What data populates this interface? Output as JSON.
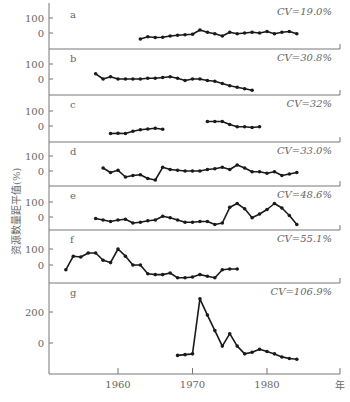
{
  "chart_data": {
    "type": "line",
    "title": "",
    "ylabel": "资源数量距平值(%)",
    "xlabel": "年",
    "x_ticks": [
      1960,
      1970,
      1980
    ],
    "grid": false,
    "legend": "none",
    "panels": [
      {
        "id": "a",
        "cv": "CV=19.0%",
        "y_ticks": [
          0,
          100
        ],
        "x": [
          1963,
          1964,
          1965,
          1966,
          1967,
          1968,
          1969,
          1970,
          1971,
          1972,
          1973,
          1974,
          1975,
          1976,
          1977,
          1978,
          1979,
          1980,
          1981,
          1982,
          1983,
          1984
        ],
        "values": [
          -40,
          -25,
          -30,
          -28,
          -20,
          -15,
          -12,
          -8,
          20,
          5,
          -5,
          -20,
          5,
          -5,
          0,
          5,
          0,
          10,
          -5,
          5,
          10,
          -5
        ]
      },
      {
        "id": "b",
        "cv": "CV=30.8%",
        "y_ticks": [
          0,
          100
        ],
        "x": [
          1957,
          1958,
          1959,
          1960,
          1961,
          1962,
          1963,
          1964,
          1965,
          1966,
          1967,
          1968,
          1969,
          1970,
          1971,
          1972,
          1973,
          1974,
          1975,
          1976,
          1977,
          1978
        ],
        "values": [
          35,
          0,
          15,
          0,
          0,
          0,
          0,
          5,
          5,
          10,
          15,
          5,
          -10,
          0,
          0,
          -10,
          -15,
          -30,
          -45,
          -55,
          -65,
          -75
        ]
      },
      {
        "id": "c",
        "cv": "CV=32%",
        "y_ticks": [
          0,
          100
        ],
        "segments": [
          {
            "x": [
              1959,
              1960,
              1961,
              1962,
              1963,
              1964,
              1965,
              1966
            ],
            "values": [
              -50,
              -48,
              -50,
              -35,
              -25,
              -20,
              -15,
              -22
            ]
          },
          {
            "x": [
              1972,
              1973,
              1974,
              1975,
              1976,
              1977,
              1978,
              1979
            ],
            "values": [
              30,
              30,
              30,
              10,
              -5,
              -5,
              -10,
              -5
            ]
          }
        ]
      },
      {
        "id": "d",
        "cv": "CV=33.0%",
        "y_ticks": [
          0,
          100
        ],
        "x": [
          1958,
          1959,
          1960,
          1961,
          1962,
          1963,
          1964,
          1965,
          1966,
          1967,
          1968,
          1969,
          1970,
          1971,
          1972,
          1973,
          1974,
          1975,
          1976,
          1977,
          1978,
          1979,
          1980,
          1981,
          1982,
          1983,
          1984
        ],
        "values": [
          20,
          -10,
          5,
          -40,
          -30,
          -25,
          -50,
          -60,
          25,
          10,
          5,
          0,
          0,
          0,
          10,
          15,
          25,
          10,
          40,
          20,
          -5,
          -5,
          -15,
          -5,
          -30,
          -20,
          -10
        ]
      },
      {
        "id": "e",
        "cv": "CV=48.6%",
        "y_ticks": [
          0,
          100
        ],
        "x": [
          1957,
          1958,
          1959,
          1960,
          1961,
          1962,
          1963,
          1964,
          1965,
          1966,
          1967,
          1968,
          1969,
          1970,
          1971,
          1972,
          1973,
          1974,
          1975,
          1976,
          1977,
          1978,
          1979,
          1980,
          1981,
          1982,
          1983,
          1984
        ],
        "values": [
          -10,
          -20,
          -30,
          -20,
          -15,
          -40,
          -35,
          -25,
          -20,
          5,
          -5,
          -20,
          -35,
          -35,
          -30,
          -30,
          -50,
          -40,
          65,
          90,
          55,
          -5,
          20,
          50,
          90,
          60,
          10,
          -50
        ]
      },
      {
        "id": "f",
        "cv": "CV=55.1%",
        "y_ticks": [
          0,
          100
        ],
        "x": [
          1953,
          1954,
          1955,
          1956,
          1957,
          1958,
          1959,
          1960,
          1961,
          1962,
          1963,
          1964,
          1965,
          1966,
          1967,
          1968,
          1969,
          1970,
          1971,
          1972,
          1973,
          1974,
          1975,
          1976
        ],
        "values": [
          -30,
          55,
          50,
          75,
          75,
          30,
          15,
          100,
          55,
          0,
          0,
          -55,
          -60,
          -60,
          -50,
          -80,
          -80,
          -75,
          -60,
          -70,
          -80,
          -30,
          -25,
          -25
        ]
      },
      {
        "id": "g",
        "cv": "CV=106.9%",
        "y_ticks": [
          0,
          200
        ],
        "x": [
          1968,
          1969,
          1970,
          1971,
          1972,
          1973,
          1974,
          1975,
          1976,
          1977,
          1978,
          1979,
          1980,
          1981,
          1982,
          1983,
          1984
        ],
        "values": [
          -80,
          -75,
          -70,
          285,
          180,
          80,
          -20,
          60,
          -20,
          -70,
          -60,
          -40,
          -55,
          -70,
          -90,
          -100,
          -105
        ]
      }
    ]
  },
  "axis": {
    "x_tick_labels": [
      "1960",
      "1970",
      "1980"
    ],
    "x_unit": "年",
    "y_title": "资源数量距平值(%)"
  }
}
